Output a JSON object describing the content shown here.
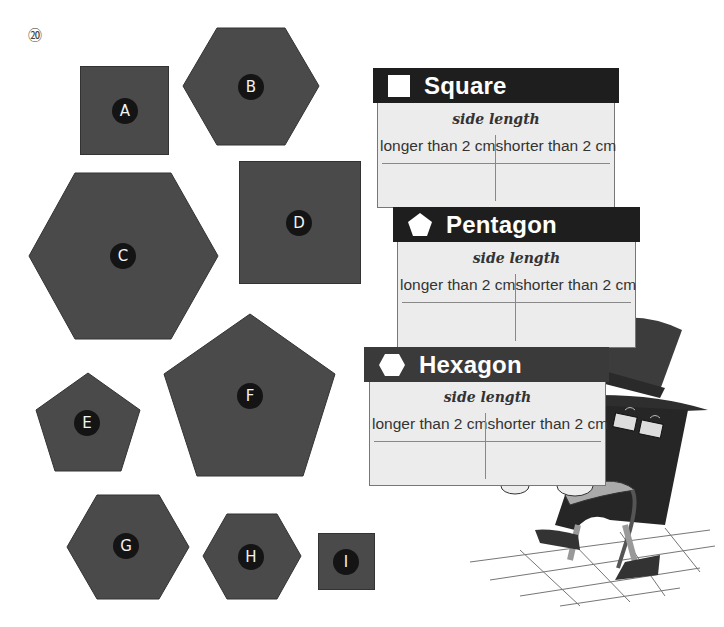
{
  "question_number": "⑳",
  "colors": {
    "shape_fill": "#4a4a4a",
    "label_bg": "#141414",
    "card_header": "#1e1e1e",
    "card_body": "#ececec"
  },
  "shapes": [
    {
      "label": "A",
      "type": "square"
    },
    {
      "label": "B",
      "type": "hexagon"
    },
    {
      "label": "C",
      "type": "hexagon"
    },
    {
      "label": "D",
      "type": "square"
    },
    {
      "label": "E",
      "type": "pentagon"
    },
    {
      "label": "F",
      "type": "pentagon"
    },
    {
      "label": "G",
      "type": "hexagon"
    },
    {
      "label": "H",
      "type": "hexagon"
    },
    {
      "label": "I",
      "type": "square"
    }
  ],
  "cards": [
    {
      "title": "Square",
      "icon": "square-icon",
      "subtitle": "side length",
      "col1": "longer than 2 cm",
      "col2": "shorter than 2 cm"
    },
    {
      "title": "Pentagon",
      "icon": "pentagon-icon",
      "subtitle": "side length",
      "col1": "longer than 2 cm",
      "col2": "shorter than 2 cm"
    },
    {
      "title": "Hexagon",
      "icon": "hexagon-icon",
      "subtitle": "side length",
      "col1": "longer than 2 cm",
      "col2": "shorter than 2 cm"
    }
  ]
}
